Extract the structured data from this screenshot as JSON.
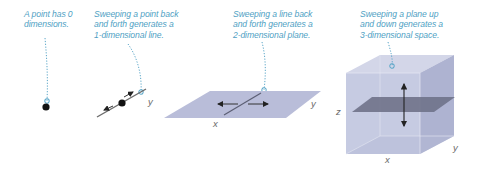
{
  "panels": [
    {
      "id": "point",
      "dimension": 0,
      "caption": "A point has 0\ndimensions."
    },
    {
      "id": "line",
      "dimension": 1,
      "caption": "Sweeping a point back\nand forth generates a\n1-dimensional line.",
      "axis_labels": {
        "y": "y"
      }
    },
    {
      "id": "plane",
      "dimension": 2,
      "caption": "Sweeping a line back\nand forth generates a\n2-dimensional plane.",
      "axis_labels": {
        "x": "x",
        "y": "y"
      }
    },
    {
      "id": "space",
      "dimension": 3,
      "caption": "Sweeping a plane up\nand down generates a\n3-dimensional space.",
      "axis_labels": {
        "x": "x",
        "y": "y",
        "z": "z"
      }
    }
  ],
  "colors": {
    "caption": "#4f9fc4",
    "leader_line": "#5aa6c8",
    "plane_fill": "#b9bdd9",
    "cube_front": "#c3c8e0",
    "cube_side": "#aeb3d1",
    "cube_top": "#d3d6e8",
    "inner_plane": "#6f7289",
    "point": "#111111"
  }
}
